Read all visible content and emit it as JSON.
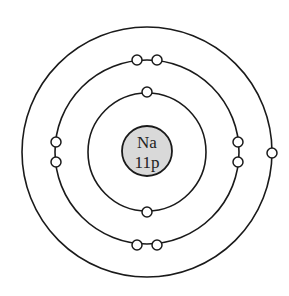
{
  "diagram": {
    "type": "bohr-model",
    "element_symbol": "Na",
    "nucleus_label": "11p",
    "center": [
      147,
      152
    ],
    "nucleus": {
      "radius": 25,
      "fill": "#d9d9d9"
    },
    "shells": [
      {
        "name": "shell-1",
        "radius": 59,
        "electrons": 2
      },
      {
        "name": "shell-2",
        "radius": 92,
        "electrons": 8
      },
      {
        "name": "shell-3",
        "radius": 125,
        "electrons": 1
      }
    ],
    "electron_configuration": "2, 8, 1",
    "stroke_color": "#1a1a1a",
    "background_color": "#ffffff"
  }
}
